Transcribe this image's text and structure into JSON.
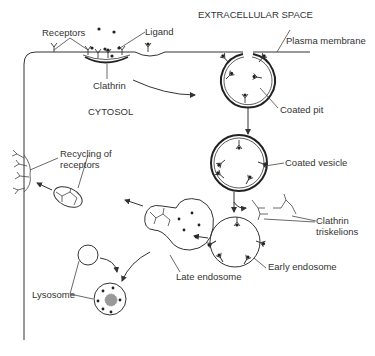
{
  "diagram": {
    "type": "receptor-mediated endocytosis",
    "colors": {
      "stroke": "#333333",
      "background": "#ffffff",
      "lysosome_core": "#999999"
    },
    "labels": {
      "extracellular_space": "EXTRACELLULAR SPACE",
      "plasma_membrane": "Plasma membrane",
      "receptors": "Receptors",
      "ligand": "Ligand",
      "clathrin": "Clathrin",
      "cytosol": "CYTOSOL",
      "coated_pit": "Coated pit",
      "coated_vesicle": "Coated vesicle",
      "clathrin_triskelions_line1": "Clathrin",
      "clathrin_triskelions_line2": "triskelions",
      "early_endosome": "Early endosome",
      "late_endosome": "Late endosome",
      "recycling_line1": "Recycling of",
      "recycling_line2": "receptors",
      "lysosome": "Lysosome"
    }
  }
}
